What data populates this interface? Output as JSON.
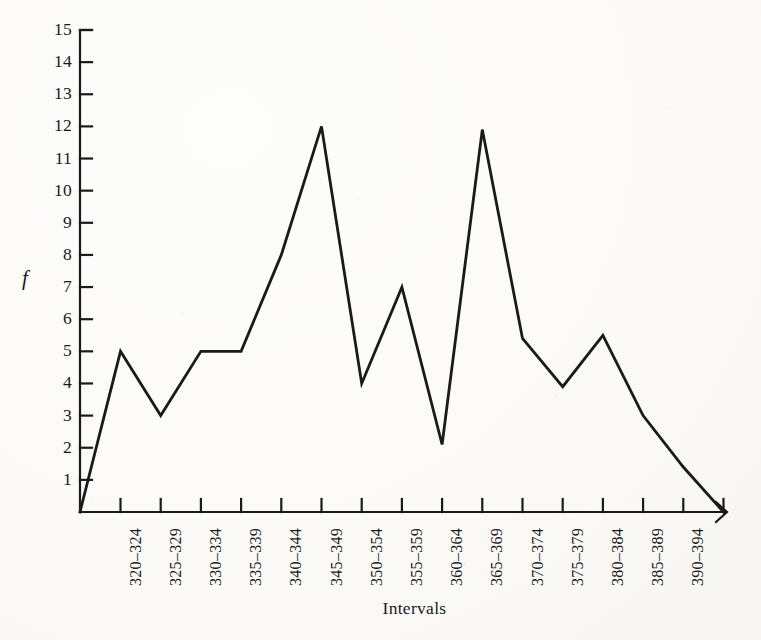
{
  "chart_data": {
    "type": "line",
    "title": "",
    "subtitle": "",
    "xlabel": "Intervals",
    "ylabel": "f",
    "categories": [
      "320–324",
      "325–329",
      "330–334",
      "335–339",
      "340–344",
      "345–349",
      "350–354",
      "355–359",
      "360–364",
      "365–369",
      "370–374",
      "375–379",
      "380–384",
      "385–389",
      "390–394"
    ],
    "values": [
      5,
      3,
      5,
      5,
      8,
      12,
      4,
      7,
      2.1,
      11.9,
      5.4,
      3.9,
      5.5,
      3,
      1.4
    ],
    "closed_at_zero_start": 0,
    "closed_at_zero_end": 0,
    "xlim_note": "frequency polygon: line anchored to 0 at the origin and at one unlabeled tick past 390–394",
    "ylim": [
      0,
      15
    ],
    "yticks": [
      1,
      2,
      3,
      4,
      5,
      6,
      7,
      8,
      9,
      10,
      11,
      12,
      13,
      14,
      15
    ],
    "ytick_labels": [
      "1",
      "2",
      "3",
      "4",
      "5",
      "6",
      "7",
      "8",
      "9",
      "10",
      "11",
      "12",
      "13",
      "14",
      "15"
    ],
    "grid": false,
    "legend": null,
    "line_color": "#1a1a1a",
    "axis_color": "#1a1a1a",
    "background_color": "#faf9f6",
    "markers": false,
    "x_axis_arrow": true,
    "unlabeled_trailing_tick": true
  },
  "axes": {
    "y_label_text": "f",
    "x_label_text": "Intervals"
  }
}
